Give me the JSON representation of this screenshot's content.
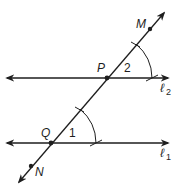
{
  "figure": {
    "type": "geometry-construction",
    "colors": {
      "ink": "#1e1e1e",
      "background": "#ffffff"
    }
  },
  "lines": {
    "l2": {
      "label": "ℓ",
      "subscript": "2"
    },
    "l1": {
      "label": "ℓ",
      "subscript": "1"
    },
    "transversal": {
      "label": "MN"
    }
  },
  "points": {
    "M": {
      "label": "M"
    },
    "P": {
      "label": "P"
    },
    "Q": {
      "label": "Q"
    },
    "N": {
      "label": "N"
    }
  },
  "angles": {
    "angle2": {
      "label": "2",
      "vertex": "P"
    },
    "angle1": {
      "label": "1",
      "vertex": "Q"
    }
  }
}
